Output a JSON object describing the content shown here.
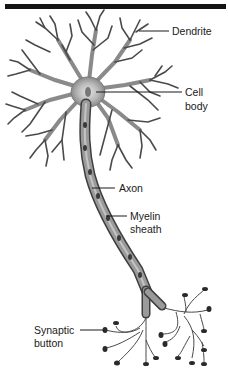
{
  "figure": {
    "colors": {
      "ink": "#1a1a1a",
      "membrane": "#7a7a7a",
      "body_fill": "#bdbdbd",
      "myelin_fill": "#8e8e8e",
      "rule": "#141414"
    }
  },
  "labels": {
    "dendrite": "Dendrite",
    "cell_body_line1": "Cell",
    "cell_body_line2": "body",
    "axon": "Axon",
    "myelin_line1": "Myelin",
    "myelin_line2": "sheath",
    "synaptic_line1": "Synaptic",
    "synaptic_line2": "button"
  }
}
